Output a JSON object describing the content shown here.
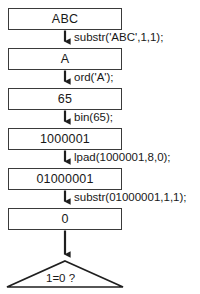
{
  "diagram": {
    "type": "flowchart",
    "background_color": "#ffffff",
    "stroke_color": "#3a3a3a",
    "text_color": "#181818",
    "nodes": [
      {
        "id": "n1",
        "shape": "rectangle",
        "label": "ABC"
      },
      {
        "id": "n2",
        "shape": "rectangle",
        "label": "A"
      },
      {
        "id": "n3",
        "shape": "rectangle",
        "label": "65"
      },
      {
        "id": "n4",
        "shape": "rectangle",
        "label": "1000001"
      },
      {
        "id": "n5",
        "shape": "rectangle",
        "label": "01000001"
      },
      {
        "id": "n6",
        "shape": "rectangle",
        "label": "0"
      },
      {
        "id": "n7",
        "shape": "decision-triangle",
        "label": "1=0 ?"
      }
    ],
    "edges": [
      {
        "from": "n1",
        "to": "n2",
        "label": "substr('ABC',1,1);",
        "arrow": "down-arrow-icon"
      },
      {
        "from": "n2",
        "to": "n3",
        "label": "ord('A');",
        "arrow": "down-arrow-icon"
      },
      {
        "from": "n3",
        "to": "n4",
        "label": "bin(65);",
        "arrow": "down-arrow-icon"
      },
      {
        "from": "n4",
        "to": "n5",
        "label": "lpad(1000001,8,0);",
        "arrow": "down-arrow-icon"
      },
      {
        "from": "n5",
        "to": "n6",
        "label": "substr(01000001,1,1);",
        "arrow": "down-arrow-icon"
      },
      {
        "from": "n6",
        "to": "n7",
        "label": "",
        "arrow": "down-arrow-icon"
      }
    ]
  }
}
